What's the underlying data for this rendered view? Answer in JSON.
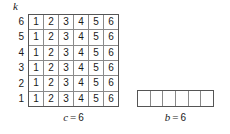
{
  "figure": {
    "axis_label": "k",
    "row_labels": [
      "6",
      "5",
      "4",
      "3",
      "2",
      "1"
    ],
    "matrix": {
      "rows": [
        [
          "1",
          "2",
          "3",
          "4",
          "5",
          "6"
        ],
        [
          "1",
          "2",
          "3",
          "4",
          "5",
          "6"
        ],
        [
          "1",
          "2",
          "3",
          "4",
          "5",
          "6"
        ],
        [
          "1",
          "2",
          "3",
          "4",
          "5",
          "6"
        ],
        [
          "1",
          "2",
          "3",
          "4",
          "5",
          "6"
        ],
        [
          "1",
          "2",
          "3",
          "4",
          "5",
          "6"
        ]
      ],
      "caption": {
        "variable": "c",
        "operator": "=",
        "value": "6"
      }
    },
    "strip": {
      "cells": [
        "",
        "",
        "",
        "",
        "",
        ""
      ],
      "caption": {
        "variable": "b",
        "operator": "=",
        "value": "6"
      }
    },
    "colors": {
      "outer_border": "#555555",
      "inner_border": "#8a8a8a",
      "cell_fill": "#ffffff",
      "text": "#1a1a1a",
      "background": "#ffffff"
    }
  }
}
